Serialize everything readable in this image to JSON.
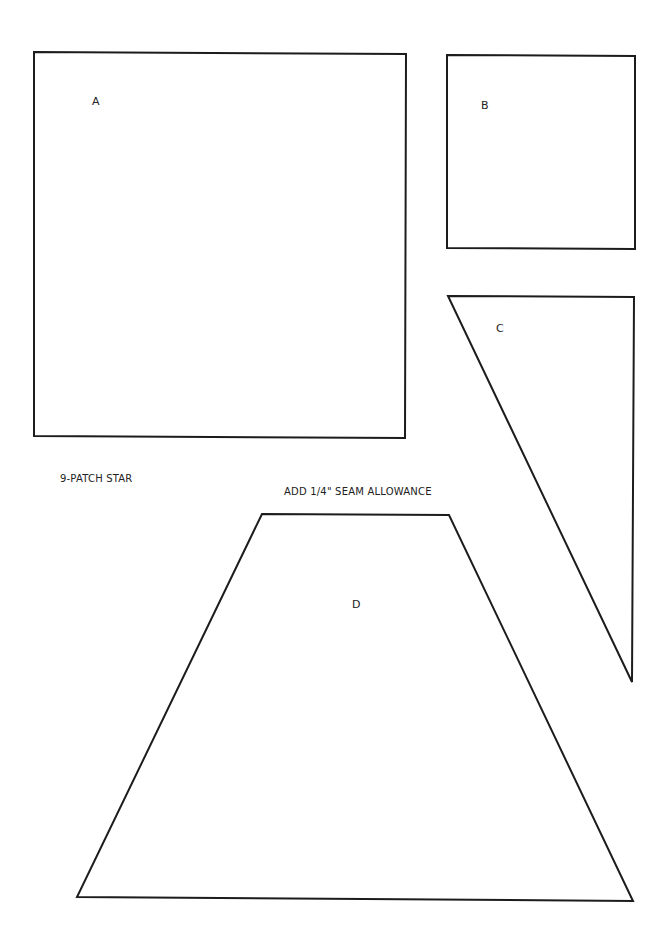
{
  "title": "9-PATCH STAR",
  "instruction": "ADD 1/4\" SEAM ALLOWANCE",
  "pieces": [
    {
      "label": "A",
      "shape": "square",
      "points": [
        [
          34,
          52
        ],
        [
          406,
          54
        ],
        [
          405,
          438
        ],
        [
          34,
          436
        ]
      ],
      "label_pos": [
        92,
        96
      ]
    },
    {
      "label": "B",
      "shape": "square",
      "points": [
        [
          447,
          55
        ],
        [
          635,
          56
        ],
        [
          635,
          249
        ],
        [
          447,
          248
        ]
      ],
      "label_pos": [
        481,
        100
      ]
    },
    {
      "label": "C",
      "shape": "right-triangle",
      "points": [
        [
          448,
          296
        ],
        [
          634,
          297
        ],
        [
          632,
          682
        ]
      ],
      "label_pos": [
        496,
        323
      ]
    },
    {
      "label": "D",
      "shape": "trapezoid",
      "points": [
        [
          262,
          514
        ],
        [
          449,
          515
        ],
        [
          633,
          901
        ],
        [
          77,
          897
        ]
      ],
      "label_pos": [
        352,
        599
      ]
    }
  ],
  "colors": {
    "line": "#1c1c1c",
    "background": "#ffffff",
    "text": "#222222"
  }
}
